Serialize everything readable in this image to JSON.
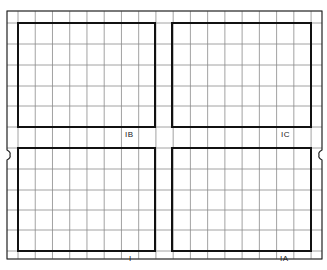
{
  "sheet": {
    "description": "Grid sheet with four bordered panels",
    "colors": {
      "grid": "#8a8a8a",
      "border": "#111111",
      "background": "#ffffff"
    }
  },
  "panels": [
    {
      "id": "1B",
      "label": "IB",
      "position": "top-left"
    },
    {
      "id": "1C",
      "label": "IC",
      "position": "top-right"
    },
    {
      "id": "1",
      "label": "I",
      "position": "bottom-left"
    },
    {
      "id": "1A",
      "label": "IA",
      "position": "bottom-right"
    }
  ]
}
